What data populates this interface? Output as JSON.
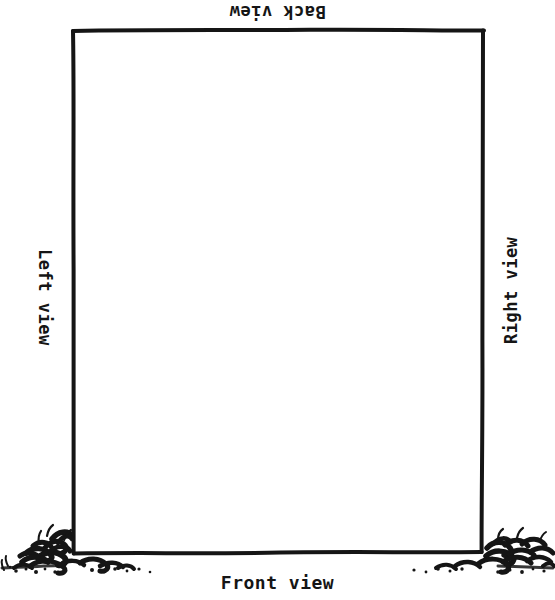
{
  "diagram": {
    "kind": "orthographic-view-labels",
    "style": "hand-drawn ink sketch",
    "background_color": "#ffffff",
    "ink_color": "#151515",
    "labels": {
      "back": "Back view",
      "front": "Front view",
      "left": "Left view",
      "right": "Right view"
    },
    "label_orientation": {
      "back": "rotated 180 degrees (upside down)",
      "front": "upright",
      "left": "rotated 90 degrees clockwise",
      "right": "rotated 90 degrees counter-clockwise"
    },
    "box": {
      "left_px": 73,
      "top_px": 30,
      "right_px": 482,
      "bottom_px": 553
    },
    "scenery": {
      "left_bush": "hand-drawn shrubbery at bottom-left corner",
      "right_bush": "hand-drawn shrubbery at bottom-right corner",
      "ground_speckle": "scattered ink dots along the ground line"
    }
  }
}
